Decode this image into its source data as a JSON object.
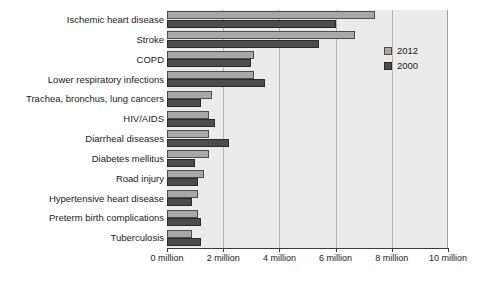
{
  "chart_data": {
    "type": "bar",
    "orientation": "horizontal",
    "title": "",
    "subtitle": "",
    "xlabel": "",
    "ylabel": "",
    "xlim": [
      0,
      10
    ],
    "xunit": "million",
    "grid": true,
    "legend_position": "top-right",
    "categories": [
      "Ischemic heart disease",
      "Stroke",
      "COPD",
      "Lower respiratory infections",
      "Trachea, bronchus, lung cancers",
      "HIV/AIDS",
      "Diarrheal diseases",
      "Diabetes mellitus",
      "Road injury",
      "Hypertensive heart disease",
      "Preterm birth complications",
      "Tuberculosis"
    ],
    "tick_values": [
      0,
      2,
      4,
      6,
      8,
      10
    ],
    "tick_labels": [
      "0 million",
      "2 million",
      "4 million",
      "6 million",
      "8 million",
      "10 million"
    ],
    "series": [
      {
        "name": "2012",
        "color": "#a8a8a8",
        "values": [
          7.4,
          6.7,
          3.1,
          3.1,
          1.6,
          1.5,
          1.5,
          1.5,
          1.3,
          1.1,
          1.1,
          0.9
        ]
      },
      {
        "name": "2000",
        "color": "#4c4c4c",
        "values": [
          6.0,
          5.4,
          3.0,
          3.5,
          1.2,
          1.7,
          2.2,
          1.0,
          1.1,
          0.9,
          1.2,
          1.2
        ]
      }
    ]
  },
  "legend": {
    "items": [
      {
        "label": "2012",
        "swatch": "light-gray-swatch"
      },
      {
        "label": "2000",
        "swatch": "dark-gray-swatch"
      }
    ]
  }
}
